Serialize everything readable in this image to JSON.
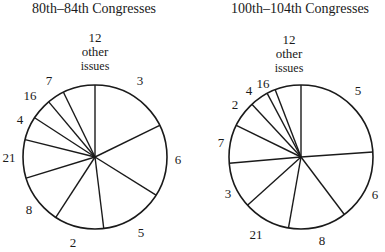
{
  "chart_data": [
    {
      "type": "pie",
      "title": "80th–84th Congresses",
      "start_angle": "north, clockwise",
      "slices": [
        {
          "label": "3",
          "angle_deg": 64
        },
        {
          "label": "6",
          "angle_deg": 58
        },
        {
          "label": "5",
          "angle_deg": 51
        },
        {
          "label": "2",
          "angle_deg": 40
        },
        {
          "label": "8",
          "angle_deg": 40
        },
        {
          "label": "21",
          "angle_deg": 31
        },
        {
          "label": "4",
          "angle_deg": 19
        },
        {
          "label": "16",
          "angle_deg": 17
        },
        {
          "label": "7",
          "angle_deg": 14
        },
        {
          "label": "12 other issues",
          "angle_deg": 26
        }
      ]
    },
    {
      "type": "pie",
      "title": "100th–104th Congresses",
      "start_angle": "north, clockwise",
      "slices": [
        {
          "label": "5",
          "angle_deg": 86
        },
        {
          "label": "6",
          "angle_deg": 57
        },
        {
          "label": "8",
          "angle_deg": 47
        },
        {
          "label": "21",
          "angle_deg": 38
        },
        {
          "label": "3",
          "angle_deg": 37
        },
        {
          "label": "7",
          "angle_deg": 31
        },
        {
          "label": "2",
          "angle_deg": 21
        },
        {
          "label": "4",
          "angle_deg": 15
        },
        {
          "label": "16",
          "angle_deg": 7
        },
        {
          "label": "12 other issues",
          "angle_deg": 21
        }
      ]
    }
  ],
  "left": {
    "title": "80th–84th Congresses",
    "other_num": "12",
    "other_l1": "other",
    "other_l2": "issues",
    "labels": [
      "3",
      "6",
      "5",
      "2",
      "8",
      "21",
      "4",
      "16",
      "7"
    ]
  },
  "right": {
    "title": "100th–104th Congresses",
    "other_num": "12",
    "other_l1": "other",
    "other_l2": "issues",
    "labels": [
      "5",
      "6",
      "8",
      "21",
      "3",
      "7",
      "2",
      "4",
      "16"
    ]
  },
  "colors": {
    "line": "#1a1a1a",
    "fill": "#ffffff"
  }
}
